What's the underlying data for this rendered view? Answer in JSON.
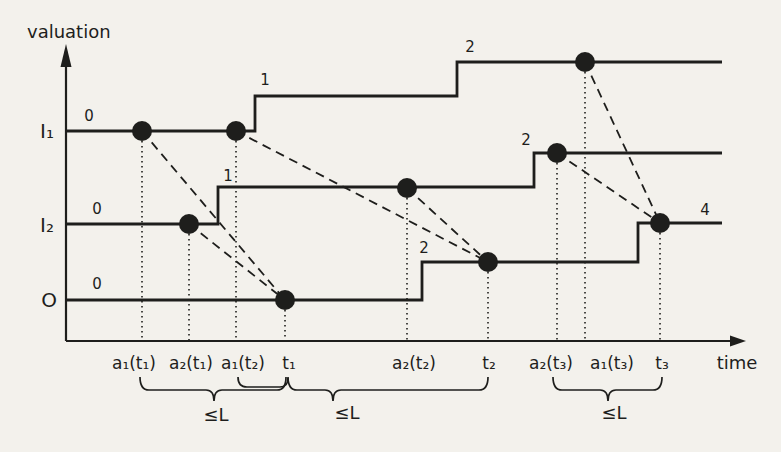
{
  "colors": {
    "background": "#f3f1ec",
    "ink": "#1e1e1c"
  },
  "axes": {
    "y_label": "valuation",
    "x_label": "time",
    "origin": {
      "x": 66,
      "y": 341
    },
    "y_arrow_tip_y": 44,
    "x_arrow_tip_x": 746,
    "y_label_pos": {
      "x": 27,
      "y": 38
    },
    "x_label_pos": {
      "x": 737,
      "y": 369
    }
  },
  "signals": [
    {
      "id": "I1",
      "label": "I₁",
      "label_pos": {
        "x": 47,
        "y": 138
      },
      "end_x": 722,
      "segments": [
        {
          "x": 66,
          "y": 131,
          "value": "0",
          "value_pos": {
            "x": 89,
            "y": 121
          }
        },
        {
          "x": 255,
          "y": 96,
          "value": "1",
          "value_pos": {
            "x": 265,
            "y": 85
          }
        },
        {
          "x": 457,
          "y": 62,
          "value": "2",
          "value_pos": {
            "x": 470,
            "y": 52
          }
        }
      ]
    },
    {
      "id": "I2",
      "label": "I₂",
      "label_pos": {
        "x": 47,
        "y": 232
      },
      "end_x": 722,
      "segments": [
        {
          "x": 66,
          "y": 224,
          "value": "0",
          "value_pos": {
            "x": 97,
            "y": 214
          }
        },
        {
          "x": 218,
          "y": 187,
          "value": "1",
          "value_pos": {
            "x": 228,
            "y": 181
          }
        },
        {
          "x": 534,
          "y": 153,
          "value": "2",
          "value_pos": {
            "x": 526,
            "y": 145
          }
        }
      ]
    },
    {
      "id": "O",
      "label": "O",
      "label_pos": {
        "x": 49,
        "y": 307
      },
      "end_x": 722,
      "segments": [
        {
          "x": 66,
          "y": 300,
          "value": "0",
          "value_pos": {
            "x": 97,
            "y": 289
          }
        },
        {
          "x": 422,
          "y": 262,
          "value": "2",
          "value_pos": {
            "x": 424,
            "y": 253
          }
        },
        {
          "x": 638,
          "y": 223,
          "value": "4",
          "value_pos": {
            "x": 705,
            "y": 215
          }
        }
      ]
    }
  ],
  "events": [
    {
      "id": "a1t1",
      "label": "a₁(t₁)",
      "x": 142,
      "y": 131,
      "label_x": 134
    },
    {
      "id": "a2t1",
      "label": "a₂(t₁)",
      "x": 189,
      "y": 224,
      "label_x": 191
    },
    {
      "id": "a1t2",
      "label": "a₁(t₂)",
      "x": 236,
      "y": 131,
      "label_x": 243
    },
    {
      "id": "t1",
      "label": "t₁",
      "x": 285,
      "y": 300,
      "label_x": 289
    },
    {
      "id": "a2t2",
      "label": "a₂(t₂)",
      "x": 407,
      "y": 188,
      "label_x": 414
    },
    {
      "id": "t2",
      "label": "t₂",
      "x": 488,
      "y": 262,
      "label_x": 489
    },
    {
      "id": "a2t3",
      "label": "a₂(t₃)",
      "x": 557,
      "y": 153,
      "label_x": 551
    },
    {
      "id": "a1t3",
      "label": "a₁(t₃)",
      "x": 585,
      "y": 62,
      "label_x": 612
    },
    {
      "id": "t3",
      "label": "t₃",
      "x": 660,
      "y": 223,
      "label_x": 662
    }
  ],
  "event_label_baseline_y": 369,
  "links": [
    {
      "from": "a1t1",
      "to": "t1"
    },
    {
      "from": "a2t1",
      "to": "t1"
    },
    {
      "from": "a1t2",
      "to": "t2"
    },
    {
      "from": "a2t2",
      "to": "t2"
    },
    {
      "from": "a2t3",
      "to": "t3"
    },
    {
      "from": "a1t3",
      "to": "t3"
    }
  ],
  "braces": [
    {
      "label": "≤L",
      "from_x": 140,
      "to_x": 286,
      "tip_x": 214,
      "label_pos": {
        "x": 216,
        "y": 421
      }
    },
    {
      "label": "≤L",
      "from_x": 238,
      "to_x": 488,
      "tip_x": 333,
      "break_x": 288,
      "label_pos": {
        "x": 347,
        "y": 419
      }
    },
    {
      "label": "≤L",
      "from_x": 553,
      "to_x": 662,
      "tip_x": 608,
      "label_pos": {
        "x": 614,
        "y": 419
      }
    }
  ]
}
